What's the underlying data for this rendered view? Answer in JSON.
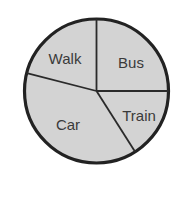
{
  "chart_data": {
    "type": "pie",
    "title": "",
    "categories": [
      "Bus",
      "Train",
      "Car",
      "Walk"
    ],
    "values": [
      25,
      16,
      38,
      21
    ],
    "unit": "percent (estimated from slice angles)",
    "start_angle_deg": 0,
    "direction": "clockwise from 12 o'clock",
    "legend": "none (labels inside slices)",
    "colors": {
      "fill": "#d3d3d3",
      "stroke": "#222222",
      "label": "#3a3a3a"
    }
  },
  "labels": {
    "bus": "Bus",
    "train": "Train",
    "car": "Car",
    "walk": "Walk"
  }
}
